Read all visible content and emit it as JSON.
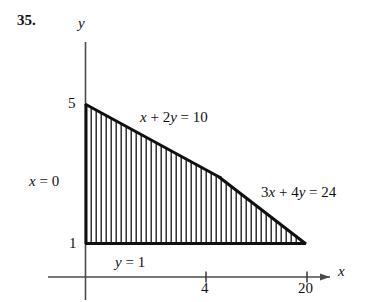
{
  "figure": {
    "exercise_number": "35.",
    "axes": {
      "x_axis_label": "x",
      "y_axis_label": "y",
      "x_ticks": [
        {
          "label": "4",
          "value": 4
        },
        {
          "label": "20",
          "value": 20
        }
      ],
      "y_ticks": [
        {
          "label": "5",
          "value": 5
        },
        {
          "label": "1",
          "value": 1
        }
      ]
    },
    "constraint_labels": [
      {
        "name": "line-x-plus-2y",
        "text": "x + 2y = 10"
      },
      {
        "name": "line-3x-plus-4y",
        "text": "3x + 4y = 24"
      },
      {
        "name": "line-x-equals-0",
        "text": "x = 0"
      },
      {
        "name": "line-y-equals-1",
        "text": "y = 1"
      }
    ],
    "colors": {
      "ink": "#111111",
      "axis": "#4a4a4a",
      "hatch": "#1a1a1a",
      "background": "#ffffff"
    }
  },
  "chart_data": {
    "type": "line",
    "title": "",
    "subtitle": "",
    "xlabel": "x",
    "ylabel": "y",
    "xlim": [
      0,
      24
    ],
    "ylim": [
      0,
      6
    ],
    "grid": false,
    "legend": "none",
    "annotations": [
      {
        "text": "x + 2y = 10",
        "kind": "constraint-boundary"
      },
      {
        "text": "3x + 4y = 24",
        "kind": "constraint-boundary"
      },
      {
        "text": "x = 0",
        "kind": "constraint-boundary"
      },
      {
        "text": "y = 1",
        "kind": "constraint-boundary"
      }
    ],
    "xticks": [
      4,
      20
    ],
    "xticklabels": [
      "4",
      "20"
    ],
    "yticks": [
      1,
      5
    ],
    "yticklabels": [
      "1",
      "5"
    ],
    "series": [
      {
        "name": "x + 2y = 10",
        "x": [
          0,
          4
        ],
        "y": [
          5,
          3
        ]
      },
      {
        "name": "3x + 4y = 24",
        "x": [
          4,
          20
        ],
        "y": [
          3,
          1
        ]
      },
      {
        "name": "x = 0",
        "x": [
          0,
          0
        ],
        "y": [
          1,
          5
        ]
      },
      {
        "name": "y = 1",
        "x": [
          0,
          20
        ],
        "y": [
          1,
          1
        ]
      }
    ],
    "shaded_region": {
      "name": "feasible-region",
      "fill": "vertical-hatching",
      "vertices": [
        {
          "x": 0,
          "y": 5
        },
        {
          "x": 4,
          "y": 3
        },
        {
          "x": 20,
          "y": 1
        },
        {
          "x": 0,
          "y": 1
        }
      ]
    }
  }
}
